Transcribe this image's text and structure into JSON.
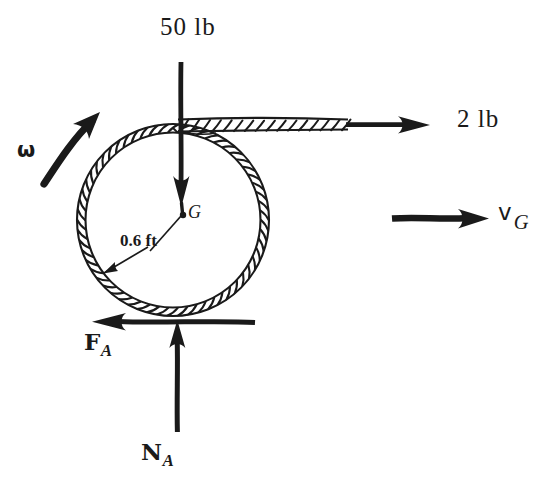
{
  "figure": {
    "kind": "free-body-diagram",
    "background_color": "#ffffff",
    "ink_color": "#1a1a1a"
  },
  "labels": {
    "weight": "50 lb",
    "cord_force": "2 lb",
    "omega": "ω",
    "velocity_symbol": "v",
    "velocity_subscript": "G",
    "center_point": "G",
    "radius": "0.6 ft",
    "friction_symbol": "F",
    "friction_subscript": "A",
    "normal_symbol": "N",
    "normal_subscript": "A"
  },
  "geometry": {
    "hoop": {
      "cx": 173,
      "cy": 220,
      "outer_r": 96,
      "inner_r": 88
    },
    "cord": {
      "x_start": 180,
      "x_rope_end": 348,
      "x_arrow_tip": 428,
      "y": 125
    },
    "weight_arrow": {
      "x": 181,
      "y_start": 62,
      "y_tip": 206
    },
    "friction_arrow": {
      "y": 322,
      "x_tail": 255,
      "x_tip": 92
    },
    "normal_arrow": {
      "x": 177,
      "y_tail": 432,
      "y_tip": 320
    },
    "velocity_arrow": {
      "y": 218,
      "x_tail": 392,
      "x_tip": 488
    },
    "omega_arrow": {
      "x_tail": 44,
      "y_tail": 180,
      "x_tip": 98,
      "y_tip": 114
    },
    "radius_leader": {
      "x_text": 152,
      "y_text": 250,
      "x_tip": 105,
      "y_tip": 272
    }
  }
}
